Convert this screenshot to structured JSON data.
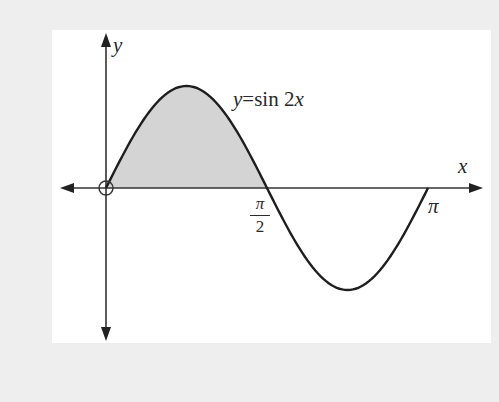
{
  "chart_data": {
    "type": "area",
    "title": "",
    "function_label": {
      "lhs": "y",
      "eq": "=",
      "rhs_func": "sin",
      "rhs_arg": "2x"
    },
    "xlabel": "x",
    "ylabel": "y",
    "x_ticks": [
      {
        "value": 1.5708,
        "label_num": "π",
        "label_den": "2"
      },
      {
        "value": 3.1416,
        "label": "π"
      }
    ],
    "xlim": [
      0,
      3.1416
    ],
    "ylim": [
      -1,
      1
    ],
    "series": [
      {
        "name": "y = sin 2x",
        "x": [
          0,
          0.3927,
          0.7854,
          1.1781,
          1.5708,
          1.9635,
          2.3562,
          2.7489,
          3.1416
        ],
        "values": [
          0,
          0.7071,
          1,
          0.7071,
          0,
          -0.7071,
          -1,
          -0.7071,
          0
        ]
      }
    ],
    "shaded_region": {
      "from": 0,
      "to": 1.5708,
      "description": "area between curve and x-axis on [0, π/2]"
    },
    "origin_marker": "open circle at origin",
    "grid": false,
    "legend": null
  },
  "labels": {
    "y_axis": "y",
    "x_axis": "x",
    "func_lhs": "y",
    "func_eq": "=",
    "func_sin": "sin 2",
    "func_x": "x",
    "half_pi_num": "π",
    "half_pi_den": "2",
    "pi": "π"
  },
  "colors": {
    "background": "#eeeeee",
    "panel": "#ffffff",
    "curve": "#1e1e1e",
    "shade": "#d4d4d4",
    "axis": "#333333"
  }
}
